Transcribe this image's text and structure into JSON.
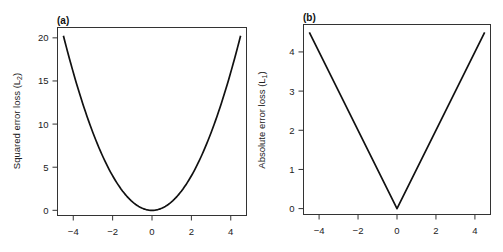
{
  "chart_data": [
    {
      "type": "line",
      "panel_label": "(a)",
      "title": "",
      "xlabel": "",
      "ylabel": "Squared error loss (L",
      "ylabel_subscript": "2",
      "ylabel_suffix": ")",
      "function": "x^2",
      "x": [
        -4.5,
        -4,
        -3.5,
        -3,
        -2.5,
        -2,
        -1.5,
        -1,
        -0.5,
        0,
        0.5,
        1,
        1.5,
        2,
        2.5,
        3,
        3.5,
        4,
        4.5
      ],
      "y": [
        20.25,
        16,
        12.25,
        9,
        6.25,
        4,
        2.25,
        1,
        0.25,
        0,
        0.25,
        1,
        2.25,
        4,
        6.25,
        9,
        12.25,
        16,
        20.25
      ],
      "xlim": [
        -4.8,
        4.8
      ],
      "ylim": [
        -0.6,
        21.2
      ],
      "xticks": [
        -4,
        -2,
        0,
        2,
        4
      ],
      "xtick_labels": [
        "−4",
        "−2",
        "0",
        "2",
        "4"
      ],
      "yticks": [
        0,
        5,
        10,
        15,
        20
      ],
      "ytick_labels": [
        "0",
        "5",
        "10",
        "15",
        "20"
      ],
      "grid": false,
      "legend": "none"
    },
    {
      "type": "line",
      "panel_label": "(b)",
      "title": "",
      "xlabel": "",
      "ylabel": "Absolute error loss (L",
      "ylabel_subscript": "1",
      "ylabel_suffix": ")",
      "function": "|x|",
      "x": [
        -4.5,
        0,
        4.5
      ],
      "y": [
        4.5,
        0,
        4.5
      ],
      "xlim": [
        -4.8,
        4.8
      ],
      "ylim": [
        -0.15,
        4.7
      ],
      "xticks": [
        -4,
        -2,
        0,
        2,
        4
      ],
      "xtick_labels": [
        "−4",
        "−2",
        "0",
        "2",
        "4"
      ],
      "yticks": [
        0,
        1,
        2,
        3,
        4
      ],
      "ytick_labels": [
        "0",
        "1",
        "2",
        "3",
        "4"
      ],
      "grid": false,
      "legend": "none"
    }
  ]
}
